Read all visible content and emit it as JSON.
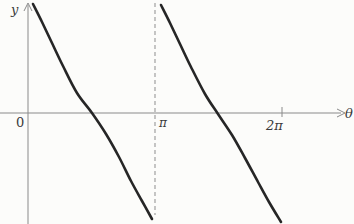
{
  "figure": {
    "background": "#fcfcfa",
    "curve_color": "#262626",
    "axis_color": "#8a8a8a",
    "asymptote_color": "#a0a0a0"
  },
  "labels": {
    "y_axis": "y",
    "origin": "0",
    "pi_tick": "π",
    "two_pi_tick": "2π",
    "theta_axis": "θ"
  },
  "chart_data": {
    "type": "line",
    "title": "",
    "xlabel": "θ",
    "ylabel": "y",
    "function": "y = cot(θ)",
    "x_ticks": [
      {
        "value": 0,
        "label": "0"
      },
      {
        "value": "π",
        "label": "π"
      },
      {
        "value": "2π",
        "label": "2π"
      }
    ],
    "vertical_asymptotes_theta": [
      "π"
    ],
    "zero_crossings_theta": [
      "π/2",
      "3π/2"
    ],
    "x_axis_range": [
      "0",
      "2π"
    ],
    "grid": false,
    "legend": "none",
    "pixel_mapping": {
      "origin_px": [
        28,
        113
      ],
      "px_per_pi": 127
    },
    "branches": [
      {
        "theta_range": "(0, π)",
        "trend": "decreasing from +∞ to −∞",
        "points_px": [
          [
            33,
            4
          ],
          [
            42,
            22
          ],
          [
            52,
            43
          ],
          [
            63,
            66
          ],
          [
            77,
            93
          ],
          [
            92,
            113
          ],
          [
            106,
            134
          ],
          [
            119,
            157
          ],
          [
            131,
            181
          ],
          [
            142,
            201
          ],
          [
            152,
            219
          ]
        ]
      },
      {
        "theta_range": "(π, 2π)",
        "trend": "decreasing from +∞ to −∞",
        "points_px": [
          [
            161,
            5
          ],
          [
            170,
            23
          ],
          [
            180,
            44
          ],
          [
            191,
            67
          ],
          [
            205,
            94
          ],
          [
            218,
            114
          ],
          [
            232,
            135
          ],
          [
            245,
            158
          ],
          [
            258,
            182
          ],
          [
            269,
            202
          ],
          [
            281,
            222
          ]
        ]
      }
    ]
  }
}
